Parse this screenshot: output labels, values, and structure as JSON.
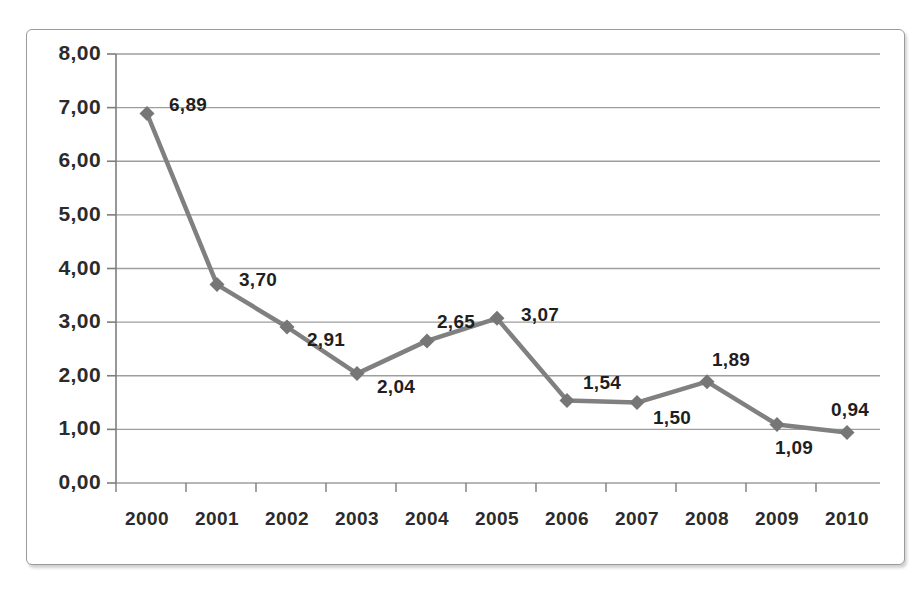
{
  "chart_data": {
    "type": "line",
    "title": "",
    "subtitle": "",
    "xlabel": "",
    "ylabel": "",
    "categories": [
      "2000",
      "2001",
      "2002",
      "2003",
      "2004",
      "2005",
      "2006",
      "2007",
      "2008",
      "2009",
      "2010"
    ],
    "values": [
      6.89,
      3.7,
      2.91,
      2.04,
      2.65,
      3.07,
      1.54,
      1.5,
      1.89,
      1.09,
      0.94
    ],
    "point_labels": [
      "6,89",
      "3,70",
      "2,91",
      "2,04",
      "2,65",
      "3,07",
      "1,54",
      "1,50",
      "1,89",
      "1,09",
      "0,94"
    ],
    "ylim": [
      0,
      8
    ],
    "ytick_values": [
      8,
      7,
      6,
      5,
      4,
      3,
      2,
      1,
      0
    ],
    "ytick_labels": [
      "8,00",
      "7,00",
      "6,00",
      "5,00",
      "4,00",
      "3,00",
      "2,00",
      "1,00",
      "0,00"
    ],
    "decimal_separator": ",",
    "grid": true,
    "grid_axis": "y",
    "legend": false,
    "legend_position": "none",
    "series": [
      {
        "name": "",
        "values": [
          6.89,
          3.7,
          2.91,
          2.04,
          2.65,
          3.07,
          1.54,
          1.5,
          1.89,
          1.09,
          0.94
        ]
      }
    ],
    "marker": "diamond",
    "colors": {
      "line": "#808080",
      "marker": "#767676",
      "grid": "#9e9e9e",
      "axis": "#7d7d7d",
      "text": "#2b2b2b",
      "background": "#ffffff",
      "border": "#9a9a9a"
    }
  }
}
